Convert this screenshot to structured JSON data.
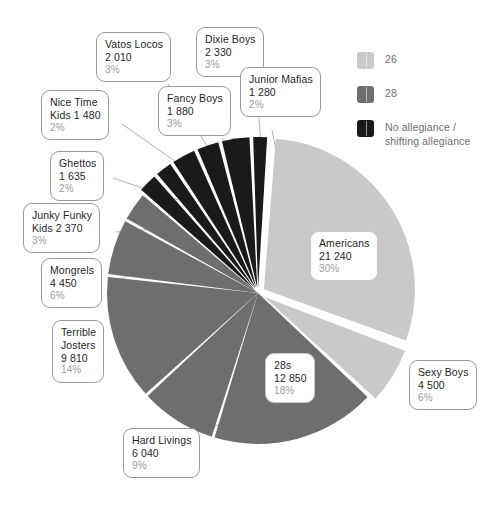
{
  "chart_data": {
    "type": "pie",
    "title": "",
    "total": 70655,
    "units": "members",
    "legend_position": "top-right",
    "grid": false,
    "categories": [
      "Americans",
      "Sexy Boys",
      "28s",
      "Hard Livings",
      "Terrible Josters",
      "Mongrels",
      "Junky Funky Kids",
      "Ghettos",
      "Nice Time Kids",
      "Vatos Locos",
      "Fancy Boys",
      "Dixie Boys",
      "Junior Mafias"
    ],
    "values": [
      21240,
      4500,
      12850,
      6040,
      9810,
      4450,
      2370,
      1635,
      1480,
      2010,
      1880,
      2330,
      1280
    ],
    "percentages": [
      30,
      6,
      18,
      9,
      14,
      6,
      3,
      2,
      2,
      3,
      3,
      3,
      2
    ],
    "group_of_slice": [
      "26",
      "26",
      "28",
      "28",
      "28",
      "28",
      "28",
      "none",
      "none",
      "none",
      "none",
      "none",
      "none"
    ],
    "groups": [
      {
        "key": "26",
        "label": "26",
        "color": "#c9c9c9"
      },
      {
        "key": "28",
        "label": "28",
        "color": "#6e6e6e"
      },
      {
        "key": "none",
        "label": "No allegiance /\nshifting allegiance",
        "color": "#1a1a1a"
      }
    ]
  },
  "legend": {
    "items": [
      {
        "label": "26",
        "color": "#c9c9c9",
        "swatch_name": "legend-swatch-26"
      },
      {
        "label": "28",
        "color": "#6e6e6e",
        "swatch_name": "legend-swatch-28"
      },
      {
        "label_line1": "No allegiance /",
        "label_line2": "shifting allegiance",
        "color": "#1a1a1a",
        "swatch_name": "legend-swatch-no-allegiance"
      }
    ]
  },
  "callouts": {
    "americans": {
      "name": "Americans",
      "value": "21 240",
      "pct": "30%"
    },
    "sexy_boys": {
      "name": "Sexy Boys",
      "value": "4 500",
      "pct": "6%"
    },
    "twenty_eights": {
      "name": "28s",
      "value": "12 850",
      "pct": "18%"
    },
    "hard_livings": {
      "name": "Hard Livings",
      "value": "6 040",
      "pct": "9%"
    },
    "terrible_josters": {
      "name_line1": "Terrible",
      "name_line2": "Josters",
      "value": "9 810",
      "pct": "14%"
    },
    "mongrels": {
      "name": "Mongrels",
      "value": "4 450",
      "pct": "6%"
    },
    "junky_funky_kids": {
      "name_line1": "Junky Funky",
      "name_line2": "Kids 2 370",
      "pct": "3%"
    },
    "ghettos": {
      "name": "Ghettos",
      "value": "1 635",
      "pct": "2%"
    },
    "nice_time_kids": {
      "name_line1": "Nice Time",
      "name_line2": "Kids 1 480",
      "pct": "2%"
    },
    "vatos_locos": {
      "name": "Vatos Locos",
      "value": "2 010",
      "pct": "3%"
    },
    "fancy_boys": {
      "name": "Fancy Boys",
      "value": "1 880",
      "pct": "3%"
    },
    "dixie_boys": {
      "name": "Dixie Boys",
      "value": "2 330",
      "pct": "3%"
    },
    "junior_mafias": {
      "name": "Junior Mafias",
      "value": "1 280",
      "pct": "2%"
    }
  }
}
